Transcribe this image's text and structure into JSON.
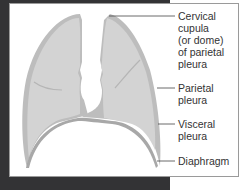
{
  "diagram": {
    "labels": [
      {
        "id": "cervical-cupula",
        "text": "Cervical\ncupula\n(or dome)\nof parietal\npleura"
      },
      {
        "id": "parietal-pleura",
        "text": "Parietal\npleura"
      },
      {
        "id": "visceral-pleura",
        "text": "Visceral\npleura"
      },
      {
        "id": "diaphragm",
        "text": "Diaphragm"
      }
    ],
    "colors": {
      "frame": "#333335",
      "lung_fill": "#d3d3d3",
      "pleura_band": "#bdbdbd",
      "leader_line": "#444444",
      "text": "#333333"
    }
  }
}
